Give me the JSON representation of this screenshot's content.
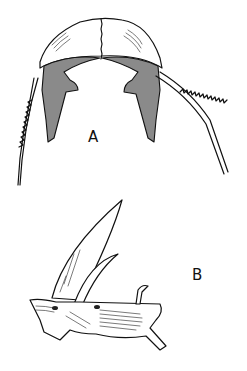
{
  "figure": {
    "labels": {
      "a": "A",
      "b": "B"
    },
    "parts": [
      {
        "id": "A",
        "description": "dorsal view: shield with serrated spines"
      },
      {
        "id": "B",
        "description": "lateral view: spines and base"
      }
    ],
    "colors": {
      "ink": "#111111",
      "background": "#ffffff",
      "shading": "#8a8a8a"
    }
  }
}
